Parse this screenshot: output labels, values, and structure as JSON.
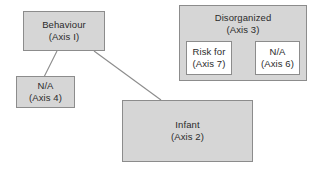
{
  "diagram": {
    "type": "node-link-diagram",
    "background_color": "#ffffff",
    "node_fill_color": "#d6d6d6",
    "inner_node_fill_color": "#ffffff",
    "border_color": "#8c8c8c",
    "text_color": "#2b2b2b",
    "nodes": {
      "behaviour": {
        "title": "Behaviour",
        "axis": "(Axis I)",
        "x": 23,
        "y": 11,
        "width": 82,
        "height": 40
      },
      "na_axis4": {
        "title": "N/A",
        "axis": "(Axis 4)",
        "x": 16,
        "y": 76,
        "width": 59,
        "height": 32
      },
      "infant": {
        "title": "Infant",
        "axis": "(Axis 2)",
        "x": 122,
        "y": 100,
        "width": 131,
        "height": 62
      },
      "disorganized": {
        "title": "Disorganized",
        "axis": "(Axis 3)",
        "x": 179,
        "y": 5,
        "width": 128,
        "height": 76
      },
      "risk_for_axis7": {
        "title": "Risk for",
        "axis": "(Axis 7)",
        "x": 186,
        "y": 41,
        "width": 46,
        "height": 34
      },
      "na_axis6": {
        "title": "N/A",
        "axis": "(Axis 6)",
        "x": 255,
        "y": 41,
        "width": 45,
        "height": 34
      }
    },
    "connectors": [
      {
        "name": "behaviour-to-na-axis4",
        "x1": 57,
        "y1": 51,
        "x2": 44,
        "y2": 77
      },
      {
        "name": "behaviour-to-infant",
        "x1": 94,
        "y1": 51,
        "x2": 161,
        "y2": 100
      }
    ]
  }
}
